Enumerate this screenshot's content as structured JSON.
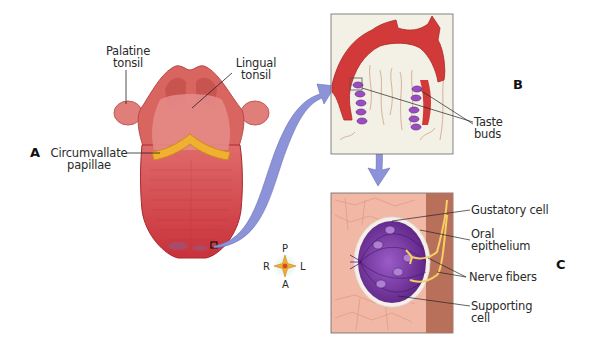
{
  "figure": {
    "panels": {
      "A": {
        "letter": "A",
        "subject": "tongue-dorsal-view"
      },
      "B": {
        "letter": "B",
        "subject": "papilla-section"
      },
      "C": {
        "letter": "C",
        "subject": "taste-bud-detail"
      }
    },
    "labels": {
      "palatine_tonsil_1": "Palatine",
      "palatine_tonsil_2": "tonsil",
      "lingual_tonsil_1": "Lingual",
      "lingual_tonsil_2": "tonsil",
      "circumvallate_1": "Circumvallate",
      "circumvallate_2": "papillae",
      "taste_buds_1": "Taste",
      "taste_buds_2": "buds",
      "gustatory_cell": "Gustatory cell",
      "oral_epithelium_1": "Oral",
      "oral_epithelium_2": "epithelium",
      "nerve_fibers": "Nerve fibers",
      "supporting_cell_1": "Supporting",
      "supporting_cell_2": "cell"
    },
    "compass": {
      "top": "P",
      "bottom": "A",
      "left": "R",
      "right": "L"
    },
    "colors": {
      "tongue": "#d9454a",
      "tongue_dark": "#b8282e",
      "papillae": "#f0b030",
      "arrow": "#8c93d8",
      "taste_bud": "#7a3aa8",
      "epithelium": "#f0b8a8",
      "nerve": "#f5d060",
      "box_bg": "#f3f0e6"
    }
  }
}
